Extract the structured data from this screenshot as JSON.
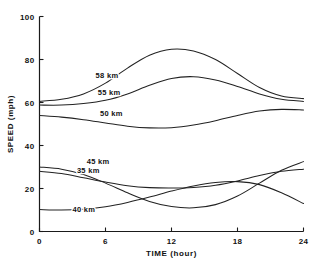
{
  "chart_data": {
    "type": "line",
    "title": "",
    "xlabel": "TIME  (hour)",
    "ylabel": "SPEED  (mph)",
    "xlim": [
      0,
      24
    ],
    "ylim": [
      0,
      100
    ],
    "xticks": [
      0,
      6,
      12,
      18,
      24
    ],
    "xtick_labels": [
      "0",
      "6",
      "12",
      "18",
      "24"
    ],
    "yticks": [
      0,
      20,
      40,
      60,
      80,
      100
    ],
    "ytick_labels": [
      "0",
      "20",
      "40",
      "60",
      "80",
      "100"
    ],
    "grid": false,
    "legend": "inline-curve-labels",
    "x": [
      0,
      2,
      4,
      6,
      8,
      10,
      12,
      14,
      16,
      18,
      20,
      22,
      24
    ],
    "series": [
      {
        "name": "58 km",
        "label": "58 km",
        "label_x": 5.1,
        "label_y": 71.5,
        "values": [
          60.5,
          61.5,
          64.0,
          69.0,
          76.0,
          82.0,
          84.8,
          84.0,
          80.0,
          73.5,
          67.0,
          63.0,
          61.8
        ]
      },
      {
        "name": "55 km",
        "label": "55 km",
        "label_x": 5.3,
        "label_y": 63.5,
        "values": [
          58.8,
          58.8,
          59.5,
          61.0,
          64.0,
          68.0,
          71.2,
          72.0,
          70.5,
          67.5,
          64.0,
          61.5,
          60.5
        ]
      },
      {
        "name": "50 km",
        "label": "50 km",
        "label_x": 5.5,
        "label_y": 53.5,
        "values": [
          54.0,
          53.2,
          52.0,
          50.5,
          49.0,
          48.2,
          48.3,
          49.5,
          51.5,
          54.0,
          56.0,
          56.8,
          56.5
        ]
      },
      {
        "name": "45 km",
        "label": "45 km",
        "label_x": 4.3,
        "label_y": 31.5,
        "values": [
          30.0,
          29.0,
          26.5,
          22.5,
          18.0,
          14.0,
          11.6,
          11.0,
          12.5,
          16.5,
          22.5,
          28.5,
          32.5
        ]
      },
      {
        "name": "35 km",
        "label": "35 km",
        "label_x": 3.4,
        "label_y": 27.0,
        "values": [
          28.0,
          27.0,
          25.0,
          23.0,
          21.3,
          20.4,
          20.2,
          20.5,
          21.5,
          23.5,
          26.0,
          28.0,
          29.0
        ]
      },
      {
        "name": "40 km",
        "label": "40 km",
        "label_x": 3.0,
        "label_y": 9.0,
        "values": [
          10.2,
          10.0,
          10.3,
          11.5,
          13.5,
          16.0,
          18.8,
          21.2,
          22.8,
          23.2,
          21.8,
          18.0,
          13.0
        ]
      }
    ]
  },
  "axis": {
    "x_title": "TIME  (hour)",
    "y_title": "SPEED  (mph)"
  }
}
